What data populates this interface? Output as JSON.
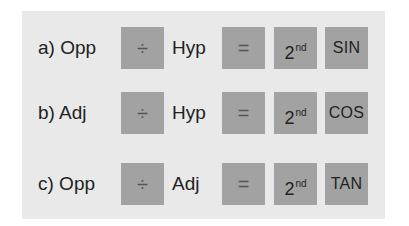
{
  "rows": [
    {
      "label": "a) Opp",
      "operator": "÷",
      "denominator": "Hyp",
      "equals": "=",
      "second_base": "2",
      "second_sup": "nd",
      "function": "SIN"
    },
    {
      "label": "b) Adj",
      "operator": "÷",
      "denominator": "Hyp",
      "equals": "=",
      "second_base": "2",
      "second_sup": "nd",
      "function": "COS"
    },
    {
      "label": "c) Opp",
      "operator": "÷",
      "denominator": "Adj",
      "equals": "=",
      "second_base": "2",
      "second_sup": "nd",
      "function": "TAN"
    }
  ],
  "colors": {
    "panel_bg": "#e9e9e9",
    "key_bg": "#a2a2a2",
    "text": "#222222"
  }
}
